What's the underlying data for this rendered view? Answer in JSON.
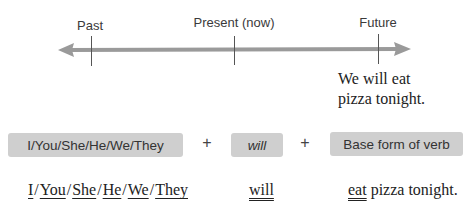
{
  "timeline": {
    "labels": {
      "past": "Past",
      "present": "Present (now)",
      "future": "Future"
    },
    "example_sentence_line1": "We will eat",
    "example_sentence_line2": "pizza tonight.",
    "arrow_color": "#9a9a9a"
  },
  "formula": {
    "subject_box": "I/You/She/He/We/They",
    "plus1": "+",
    "will_box": "will",
    "plus2": "+",
    "verb_box": "Base form of verb",
    "box_color": "#cfcfcf"
  },
  "example": {
    "subjects": [
      "I",
      "You",
      "She",
      "He",
      "We",
      "They"
    ],
    "separator": "/",
    "will": "will",
    "verb": "eat",
    "rest": " pizza tonight."
  }
}
